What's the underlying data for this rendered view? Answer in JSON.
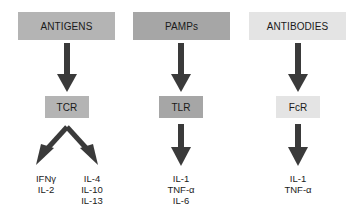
{
  "columns": [
    {
      "source": "ANTIGENS",
      "receptor": "TCR",
      "source_color": "#b4b4b4",
      "receptor_color": "#b4b4b4",
      "outputs_left": [
        "IFNγ",
        "IL-2"
      ],
      "outputs_right": [
        "IL-4",
        "IL-10",
        "IL-13"
      ]
    },
    {
      "source": "PAMPs",
      "receptor": "TLR",
      "source_color": "#a6a6a6",
      "receptor_color": "#a6a6a6",
      "outputs": [
        "IL-1",
        "TNF-α",
        "IL-6"
      ]
    },
    {
      "source": "ANTIBODIES",
      "receptor": "FcR",
      "source_color": "#e4e4e4",
      "receptor_color": "#e4e4e4",
      "outputs": [
        "IL-1",
        "TNF-α"
      ]
    }
  ],
  "colors": {
    "arrow": "#3a3a3a",
    "text": "#1a1a1a",
    "background": "#ffffff"
  }
}
